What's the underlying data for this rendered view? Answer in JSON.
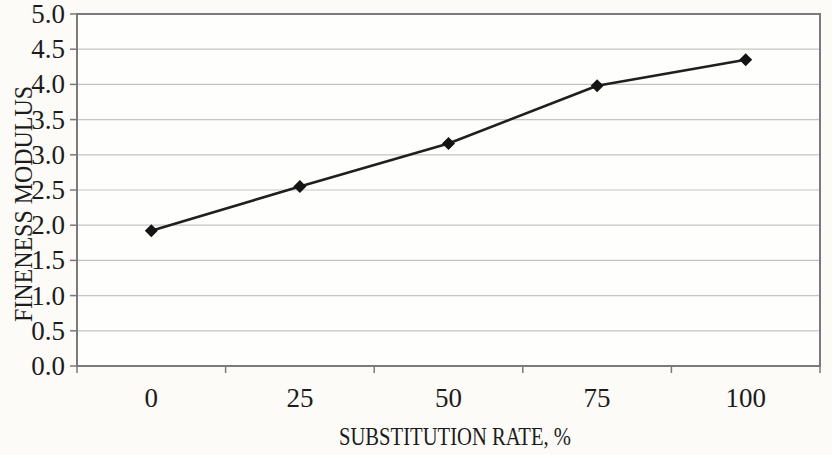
{
  "chart_data": {
    "type": "line",
    "title": "",
    "xlabel": "SUBSTITUTION RATE, %",
    "ylabel": "FINENESS MODULUS",
    "categories": [
      "0",
      "25",
      "50",
      "75",
      "100"
    ],
    "series": [
      {
        "name": "fineness-modulus",
        "values": [
          1.92,
          2.55,
          3.16,
          3.98,
          4.35
        ],
        "line_color": "#1f1f1f",
        "marker": "diamond",
        "marker_color": "#141414"
      }
    ],
    "ylim": [
      0.0,
      5.0
    ],
    "ytick_step": 0.5,
    "ytick_labels": [
      "0.0",
      "0.5",
      "1.0",
      "1.5",
      "2.0",
      "2.5",
      "3.0",
      "3.5",
      "4.0",
      "4.5",
      "5.0"
    ],
    "grid": "horizontal-only",
    "legend": "none",
    "plot_border": true,
    "colors": {
      "background": "#fcfbf8",
      "plot_background": "#fefefd",
      "gridline": "#c4c4c4",
      "axis": "#7a7a7a",
      "text": "#1c1c1c"
    }
  }
}
